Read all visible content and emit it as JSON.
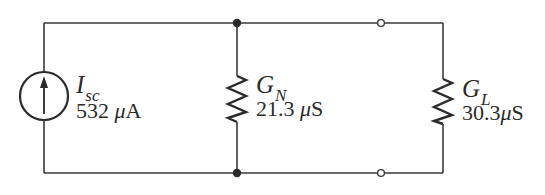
{
  "diagram": {
    "type": "circuit",
    "source": {
      "kind": "current-source",
      "direction": "up",
      "symbol": "I",
      "subscript": "sc",
      "value_number": "532",
      "value_unit_prefix": "μ",
      "value_unit": "A",
      "value_text": "532 μA"
    },
    "norton_conductance": {
      "kind": "conductance",
      "symbol": "G",
      "subscript": "N",
      "value_number": "21.3",
      "value_unit_prefix": "μ",
      "value_unit": "S",
      "value_text": "21.3 μS"
    },
    "load_conductance": {
      "kind": "conductance",
      "symbol": "G",
      "subscript": "L",
      "value_number": "30.3",
      "value_unit_prefix": "μ",
      "value_unit": "S",
      "value_text": "30.3 μS"
    },
    "nodes": {
      "top_junction": "filled-dot",
      "bottom_junction": "filled-dot",
      "top_terminal": "open-circle",
      "bottom_terminal": "open-circle"
    },
    "colors": {
      "line": "#3a3a3a",
      "text": "#2b2b2b",
      "background": "#ffffff"
    }
  }
}
